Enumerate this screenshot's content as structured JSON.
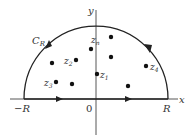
{
  "diagram": {
    "axes": {
      "x_label": "x",
      "y_label": "y",
      "origin_label": "0",
      "left_label": "−R",
      "right_label": "R"
    },
    "contour": {
      "label_main": "C",
      "label_sub": "R",
      "direction": "counterclockwise"
    },
    "points": [
      {
        "id": "z1",
        "main": "z",
        "sub": "1",
        "x": 97,
        "y": 74
      },
      {
        "id": "z2",
        "main": "z",
        "sub": "2",
        "x": 76,
        "y": 60
      },
      {
        "id": "z3",
        "main": "z",
        "sub": "3",
        "x": 56,
        "y": 82
      },
      {
        "id": "z4",
        "main": "z",
        "sub": "4",
        "x": 146,
        "y": 66
      },
      {
        "id": "zn",
        "main": "z",
        "sub": "n",
        "x": 91,
        "y": 49
      },
      {
        "id": "p6",
        "main": "",
        "sub": "",
        "x": 52,
        "y": 63
      },
      {
        "id": "p7",
        "main": "",
        "sub": "",
        "x": 111,
        "y": 37
      },
      {
        "id": "p8",
        "main": "",
        "sub": "",
        "x": 111,
        "y": 57
      },
      {
        "id": "p9",
        "main": "",
        "sub": "",
        "x": 72,
        "y": 84
      },
      {
        "id": "p10",
        "main": "",
        "sub": "",
        "x": 128,
        "y": 86
      }
    ],
    "colors": {
      "line": "#333333",
      "point": "#111111",
      "background": "#ffffff"
    }
  }
}
